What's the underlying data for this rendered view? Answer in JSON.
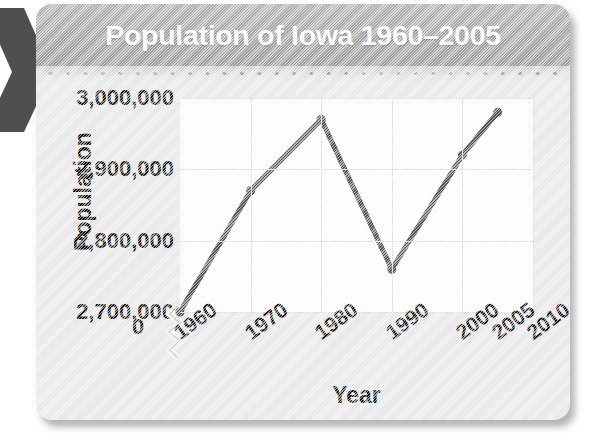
{
  "card": {
    "title": "Population of Iowa 1960–2005",
    "arrow_icon": "chevron-right-icon",
    "perforation_icon": "dotted-separator-icon",
    "colors": {
      "header_band": "#a6a6a6",
      "card_body": "#e9e9e9",
      "title_text": "#ffffff",
      "line_series": "#555555",
      "gridline": "#dedede",
      "plot_background": "#ffffff",
      "arrow": "#4f4f4f"
    }
  },
  "chart_data": {
    "type": "line",
    "title": "Population of Iowa 1960–2005",
    "xlabel": "Year",
    "ylabel": "Population",
    "x": [
      1960,
      1970,
      1980,
      1990,
      2000,
      2005
    ],
    "values": [
      2700000,
      2870000,
      2970000,
      2760000,
      2920000,
      2980000
    ],
    "series": [
      {
        "name": "Population of Iowa",
        "values": [
          2700000,
          2870000,
          2970000,
          2760000,
          2920000,
          2980000
        ]
      }
    ],
    "x_tick_labels": [
      "1960",
      "1970",
      "1980",
      "1990",
      "2000",
      "2005",
      "2010"
    ],
    "x_ticks": [
      1960,
      1970,
      1980,
      1990,
      2000,
      2005,
      2010
    ],
    "y_tick_labels": [
      "3,000,000",
      "2,900,000",
      "2,800,000",
      "2,700,000"
    ],
    "y_ticks": [
      3000000,
      2900000,
      2800000,
      2700000
    ],
    "zero_tick_label": "0",
    "xlim": [
      1960,
      2010
    ],
    "ylim": [
      2700000,
      3000000
    ],
    "y_axis_break": true,
    "grid": true,
    "legend": false,
    "marker": "circle",
    "annotations": []
  }
}
